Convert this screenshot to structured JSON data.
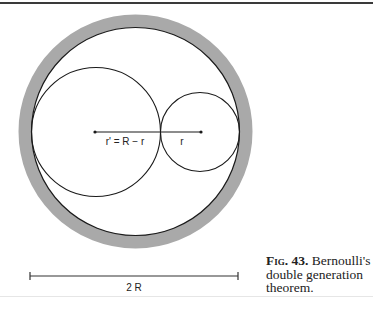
{
  "figure": {
    "labels": {
      "big_radius": "r' = R − r",
      "small_radius": "r",
      "scale": "2 R"
    },
    "colors": {
      "ring": "#a9a9a9",
      "stroke": "#1a1a1a"
    }
  },
  "caption": {
    "number": "Fig. 43.",
    "text_line1": "Bernoulli's",
    "text_line2": "double generation",
    "text_line3": "theorem."
  }
}
